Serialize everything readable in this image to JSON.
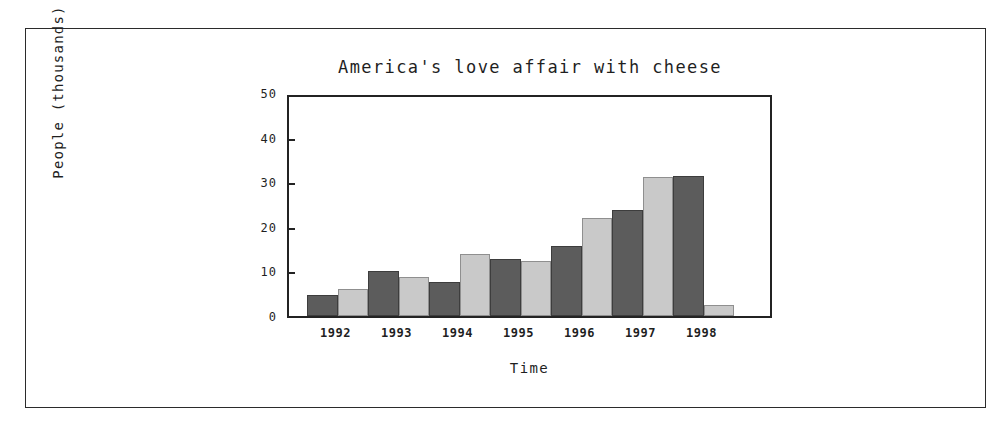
{
  "figure": {
    "frame_color": "#2b2b2b",
    "background": "#ffffff"
  },
  "chart_data": {
    "type": "bar",
    "title": "America's love affair with cheese",
    "xlabel": "Time",
    "ylabel": "People (thousands)",
    "categories": [
      "1992",
      "1993",
      "1994",
      "1995",
      "1996",
      "1997",
      "1998"
    ],
    "series": [
      {
        "name": "dark",
        "color": "#5c5c5c",
        "values": [
          4.8,
          10.1,
          7.7,
          12.8,
          15.8,
          23.7,
          31.5
        ]
      },
      {
        "name": "light",
        "color": "#c9c9c9",
        "values": [
          6.1,
          8.7,
          13.9,
          12.3,
          22.0,
          31.2,
          2.4
        ]
      }
    ],
    "ylim": [
      0,
      50
    ],
    "yticks": [
      0,
      10,
      20,
      30,
      40,
      50
    ],
    "ytick_labels": [
      "0",
      "10",
      "20",
      "30",
      "40",
      "50"
    ],
    "grid": false,
    "legend": "none"
  }
}
